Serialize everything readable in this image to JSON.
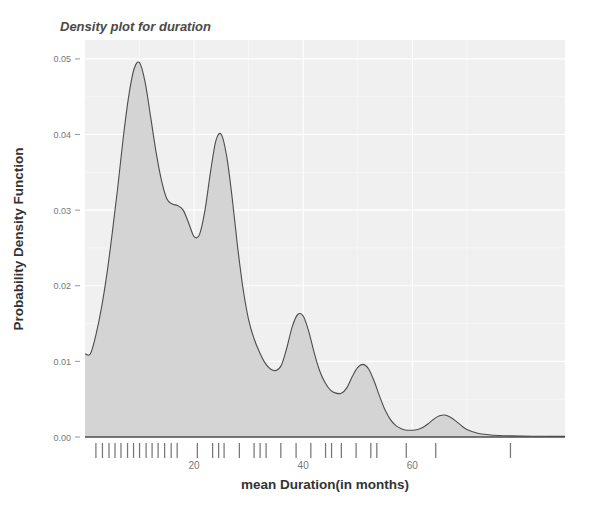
{
  "chart_data": {
    "type": "area",
    "title": "Density plot for duration",
    "xlabel": "mean Duration(in months)",
    "ylabel": "Probability Density Function",
    "xlim": [
      0,
      88
    ],
    "ylim": [
      0,
      0.0525
    ],
    "grid": true,
    "legend": null,
    "xticks": [
      20,
      40,
      60
    ],
    "xtick_labels": [
      "20",
      "40",
      "60"
    ],
    "yticks": [
      0.0,
      0.01,
      0.02,
      0.03,
      0.04,
      0.05
    ],
    "ytick_labels": [
      "0.00",
      "0.01",
      "0.02",
      "0.03",
      "0.04",
      "0.05"
    ],
    "curve_name": "density",
    "fill_color": "#d4d4d4",
    "line_color": "#4d4d4d",
    "panel_color": "#f0f0f0",
    "grid_color": "#ffffff",
    "x": [
      0,
      1,
      2,
      3,
      4,
      5,
      6,
      7,
      8,
      9,
      10,
      11,
      12,
      13,
      14,
      15,
      16,
      17,
      18,
      19,
      20,
      21,
      22,
      23,
      24,
      25,
      26,
      27,
      28,
      29,
      30,
      31,
      32,
      33,
      34,
      35,
      36,
      37,
      38,
      39,
      40,
      41,
      42,
      43,
      44,
      45,
      46,
      47,
      48,
      49,
      50,
      51,
      52,
      53,
      54,
      55,
      56,
      57,
      58,
      59,
      60,
      61,
      62,
      63,
      64,
      65,
      66,
      67,
      68,
      69,
      70,
      72,
      74,
      76,
      78,
      80,
      82,
      84,
      86,
      88
    ],
    "y": [
      0.011,
      0.011,
      0.0135,
      0.017,
      0.0215,
      0.027,
      0.033,
      0.0395,
      0.045,
      0.0487,
      0.0495,
      0.047,
      0.0425,
      0.0378,
      0.034,
      0.0315,
      0.0308,
      0.0306,
      0.03,
      0.0283,
      0.0265,
      0.0268,
      0.03,
      0.035,
      0.0392,
      0.04,
      0.037,
      0.0315,
      0.025,
      0.0195,
      0.0155,
      0.013,
      0.0112,
      0.0098,
      0.009,
      0.0088,
      0.0095,
      0.0118,
      0.0146,
      0.0162,
      0.016,
      0.014,
      0.0112,
      0.0088,
      0.0072,
      0.0062,
      0.0058,
      0.0058,
      0.0065,
      0.008,
      0.0092,
      0.0096,
      0.009,
      0.0074,
      0.0054,
      0.0036,
      0.0023,
      0.0015,
      0.0011,
      0.0009,
      0.0009,
      0.001,
      0.0013,
      0.0018,
      0.0024,
      0.0028,
      0.0029,
      0.0026,
      0.0021,
      0.0015,
      0.001,
      0.0005,
      0.0003,
      0.0002,
      0.00015,
      0.00012,
      0.0001,
      9e-05,
      8e-05,
      8e-05
    ],
    "rug_values": [
      2.0,
      3.2,
      4.4,
      5.5,
      6.6,
      7.8,
      8.9,
      10.0,
      11.2,
      12.3,
      13.4,
      14.6,
      15.8,
      16.9,
      20.6,
      23.4,
      24.5,
      25.5,
      28.3,
      31.0,
      32.1,
      33.2,
      35.9,
      38.7,
      41.4,
      44.1,
      45.2,
      47.0,
      49.7,
      52.4,
      53.5,
      58.9,
      64.3,
      78.0
    ],
    "rug_label": "rug-plot-ticks"
  },
  "plot": {
    "panel": {
      "left_px": 85,
      "right_px": 565,
      "top_px": 40,
      "bottom_px": 437
    }
  }
}
